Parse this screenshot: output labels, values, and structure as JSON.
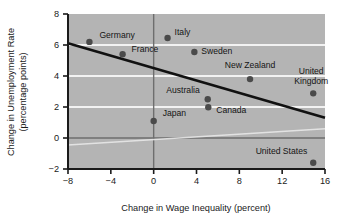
{
  "chart_data": {
    "type": "scatter",
    "title": "",
    "xlabel": "Change in Wage Inequality (percent)",
    "ylabel": "Change in Unemployment Rate\n(percentage points)",
    "ylabel_line1": "Change in Unemployment Rate",
    "ylabel_line2": "(percentage points)",
    "xlim": [
      -8,
      16
    ],
    "ylim": [
      -2,
      8
    ],
    "xticks": [
      -8,
      -4,
      0,
      4,
      8,
      12,
      16
    ],
    "xtick_labels": [
      "−8",
      "−4",
      "0",
      "4",
      "8",
      "12",
      "16"
    ],
    "yticks": [
      -2,
      0,
      2,
      4,
      6,
      8
    ],
    "ytick_labels": [
      "−2",
      "0",
      "2",
      "4",
      "6",
      "8"
    ],
    "grid": "horizontal-white-at-2-4-6",
    "gridlines_y": [
      2,
      4,
      6
    ],
    "zero_line_y": 0,
    "zero_line_x": 0,
    "legend": "none",
    "plot_bgcolor": "#b4b4b4",
    "point_color": "#4a4a4a",
    "trendline_color": "#111111",
    "points": [
      {
        "label": "Germany",
        "x": -6.0,
        "y": 6.2,
        "label_dx": 10,
        "label_dy": -4,
        "anchor": "start"
      },
      {
        "label": "France",
        "x": -2.9,
        "y": 5.4,
        "label_dx": 9,
        "label_dy": -2,
        "anchor": "start"
      },
      {
        "label": "Italy",
        "x": 1.3,
        "y": 6.45,
        "label_dx": 7,
        "label_dy": -3,
        "anchor": "start"
      },
      {
        "label": "Sweden",
        "x": 3.8,
        "y": 5.55,
        "label_dx": 7,
        "label_dy": 2,
        "anchor": "start"
      },
      {
        "label": "New Zealand",
        "x": 9.0,
        "y": 3.8,
        "label_dx": 0,
        "label_dy": -11,
        "anchor": "middle"
      },
      {
        "label": "United",
        "x": 14.9,
        "y": 2.88,
        "label_dx": -2,
        "label_dy": -19,
        "anchor": "middle"
      },
      {
        "label": "Kingdom",
        "x": 14.9,
        "y": 2.88,
        "label_dx": -2,
        "label_dy": -9,
        "anchor": "middle"
      },
      {
        "label": "Australia",
        "x": 5.05,
        "y": 2.5,
        "label_dx": -8,
        "label_dy": -6,
        "anchor": "end"
      },
      {
        "label": "Canada",
        "x": 5.1,
        "y": 1.98,
        "label_dx": 8,
        "label_dy": 6,
        "anchor": "start"
      },
      {
        "label": "Japan",
        "x": 0.0,
        "y": 1.1,
        "label_dx": 9,
        "label_dy": -5,
        "anchor": "start"
      },
      {
        "label": "United States",
        "x": 14.9,
        "y": -1.6,
        "label_dx": -6,
        "label_dy": -9,
        "anchor": "end"
      }
    ],
    "dot_points": [
      {
        "name": "Germany",
        "x": -6.0,
        "y": 6.2
      },
      {
        "name": "France",
        "x": -2.9,
        "y": 5.4
      },
      {
        "name": "Italy",
        "x": 1.3,
        "y": 6.45
      },
      {
        "name": "Sweden",
        "x": 3.8,
        "y": 5.55
      },
      {
        "name": "New Zealand",
        "x": 9.0,
        "y": 3.8
      },
      {
        "name": "United Kingdom",
        "x": 14.9,
        "y": 2.88
      },
      {
        "name": "Australia",
        "x": 5.05,
        "y": 2.5
      },
      {
        "name": "Canada",
        "x": 5.1,
        "y": 1.98
      },
      {
        "name": "Japan",
        "x": 0.0,
        "y": 1.1
      },
      {
        "name": "United States",
        "x": 14.9,
        "y": -1.6
      }
    ],
    "trendline": {
      "x1": -8,
      "y1": 6.12,
      "x2": 16,
      "y2": 1.3,
      "slope": -0.2008,
      "intercept": 4.51
    },
    "artifact_line": {
      "description": "faint white scan streak",
      "x1": -8,
      "y1": -0.45,
      "x2": 16,
      "y2": 0.6
    }
  }
}
